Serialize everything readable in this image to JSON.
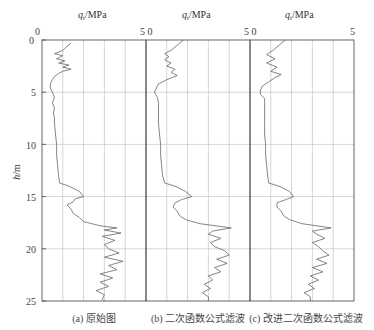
{
  "chart_data": {
    "type": "line",
    "title": "",
    "ylabel": "h/m",
    "yticks": [
      0,
      5,
      10,
      15,
      20,
      25
    ],
    "ylim": [
      0,
      25
    ],
    "y_inverted": true,
    "grid": true,
    "panels": [
      {
        "id": "a",
        "xlabel": "q_t/MPa",
        "xticks_labels": [
          "0",
          "5"
        ],
        "xlim": [
          0,
          5
        ],
        "caption": "(a) 原始图",
        "series": {
          "name": "原始图",
          "h": [
            0.3,
            0.6,
            1.0,
            1.3,
            1.5,
            1.8,
            2.0,
            2.2,
            2.4,
            2.6,
            2.8,
            3.0,
            3.2,
            3.5,
            3.8,
            4.2,
            4.6,
            5.0,
            5.5,
            6.0,
            6.5,
            7.0,
            7.5,
            8.0,
            9.0,
            10.0,
            11.0,
            12.0,
            13.0,
            13.7,
            14.0,
            14.5,
            15.0,
            15.2,
            15.5,
            15.8,
            16.2,
            16.6,
            17.0,
            17.4,
            17.8,
            18.0,
            18.2,
            18.5,
            18.8,
            19.2,
            19.6,
            20.0,
            20.4,
            20.8,
            21.2,
            21.6,
            22.0,
            22.4,
            22.8,
            23.2,
            23.6,
            24.0,
            24.4,
            24.8,
            25.0
          ],
          "qt": [
            1.4,
            1.2,
            1.0,
            0.6,
            1.0,
            0.7,
            1.1,
            0.8,
            1.3,
            1.0,
            1.4,
            1.0,
            0.8,
            0.6,
            0.5,
            0.4,
            0.4,
            0.5,
            0.6,
            0.5,
            0.6,
            0.55,
            0.6,
            0.6,
            0.65,
            0.7,
            0.7,
            0.75,
            0.8,
            0.85,
            1.3,
            1.8,
            2.0,
            1.6,
            1.5,
            1.2,
            1.4,
            1.5,
            1.8,
            2.0,
            2.8,
            3.6,
            3.0,
            3.8,
            2.9,
            3.5,
            3.0,
            3.2,
            3.7,
            3.0,
            3.9,
            3.2,
            3.6,
            2.8,
            3.4,
            2.8,
            3.2,
            2.6,
            3.0,
            2.9,
            3.0
          ]
        }
      },
      {
        "id": "b",
        "xlabel": "q_t/MPa",
        "xticks_labels": [
          "0",
          "5"
        ],
        "xlim": [
          0,
          5
        ],
        "caption": "(b) 二次函数公式滤波",
        "series": {
          "name": "二次函数公式滤波",
          "h": [
            0.0,
            0.5,
            1.0,
            1.3,
            1.6,
            1.9,
            2.2,
            2.5,
            2.8,
            3.1,
            3.4,
            3.8,
            4.2,
            4.6,
            5.0,
            5.5,
            6.0,
            7.0,
            8.0,
            9.0,
            10.0,
            11.0,
            12.0,
            13.0,
            13.7,
            14.0,
            14.5,
            15.0,
            15.3,
            15.6,
            16.0,
            16.4,
            16.8,
            17.2,
            17.6,
            18.0,
            18.3,
            18.6,
            19.0,
            19.4,
            19.8,
            20.2,
            20.6,
            21.0,
            21.4,
            21.8,
            22.2,
            22.6,
            23.0,
            23.4,
            23.8,
            24.2,
            24.6,
            25.0
          ],
          "qt": [
            1.8,
            1.5,
            1.2,
            0.9,
            1.1,
            0.9,
            1.2,
            1.0,
            1.4,
            1.2,
            1.5,
            1.0,
            0.6,
            0.5,
            0.4,
            0.55,
            0.6,
            0.6,
            0.6,
            0.65,
            0.7,
            0.7,
            0.75,
            0.8,
            0.9,
            1.4,
            1.9,
            2.2,
            1.7,
            1.4,
            1.3,
            1.5,
            1.6,
            1.9,
            2.6,
            4.1,
            3.2,
            3.0,
            3.6,
            3.1,
            3.3,
            3.8,
            4.0,
            3.4,
            3.9,
            3.3,
            3.6,
            3.0,
            3.2,
            2.8,
            3.1,
            2.7,
            3.0,
            3.0
          ]
        }
      },
      {
        "id": "c",
        "xlabel": "q_t/MPa",
        "xticks_labels": [
          "0",
          "5"
        ],
        "xlim": [
          0,
          5
        ],
        "caption": "(c) 改进二次函数公式滤波",
        "series": {
          "name": "改进二次函数公式滤波",
          "h": [
            0.0,
            0.5,
            1.0,
            1.4,
            1.8,
            2.2,
            2.6,
            3.0,
            3.3,
            3.6,
            4.0,
            4.4,
            4.8,
            5.2,
            5.6,
            6.0,
            7.0,
            8.0,
            9.0,
            10.0,
            11.0,
            12.0,
            13.0,
            13.7,
            14.0,
            14.5,
            15.0,
            15.3,
            15.6,
            16.0,
            16.4,
            16.8,
            17.2,
            17.6,
            18.0,
            18.3,
            18.6,
            19.0,
            19.4,
            19.8,
            20.2,
            20.6,
            21.0,
            21.4,
            21.8,
            22.2,
            22.6,
            23.0,
            23.4,
            23.8,
            24.2,
            24.6,
            25.0
          ],
          "qt": [
            1.7,
            1.4,
            1.1,
            0.8,
            1.2,
            0.8,
            1.3,
            1.0,
            1.5,
            1.2,
            0.9,
            0.6,
            0.5,
            0.5,
            0.7,
            0.7,
            0.7,
            0.7,
            0.7,
            0.75,
            0.75,
            0.8,
            0.85,
            0.9,
            1.4,
            1.9,
            2.1,
            1.7,
            1.3,
            1.3,
            1.5,
            1.6,
            1.9,
            2.5,
            3.9,
            3.0,
            3.2,
            3.6,
            3.0,
            3.3,
            3.5,
            3.8,
            3.2,
            3.7,
            3.0,
            3.5,
            2.9,
            3.3,
            2.8,
            3.1,
            2.6,
            2.9,
            2.9
          ]
        }
      }
    ]
  },
  "axis": {
    "xlabel_q": "q",
    "xlabel_sub": "t",
    "xlabel_unit": "/MPa",
    "ylabel_h": "h",
    "ylabel_unit": "/m",
    "tick_0": "0",
    "tick_5": "5",
    "tick_50": "5 0",
    "yticks": [
      "0",
      "5",
      "10",
      "15",
      "20",
      "25"
    ]
  },
  "captions": [
    "(a) 原始图",
    "(b) 二次函数公式滤波",
    "(c) 改进二次函数公式滤波"
  ],
  "colors": {
    "curve": "#666666",
    "frame": "#555555",
    "grid": "#bbbbbb",
    "background": "#ffffff"
  }
}
